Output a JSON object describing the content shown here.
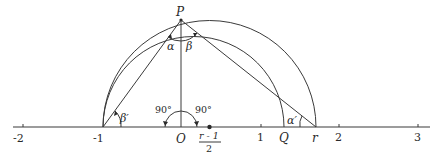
{
  "figure": {
    "type": "geometric construction on real number line",
    "colors": {
      "ink": "#3a3a3a",
      "background": "#ffffff"
    },
    "axis": {
      "tick_labels": [
        "-2",
        "-1",
        "1",
        "2",
        "3"
      ],
      "tick_values": [
        -2,
        -1,
        1,
        2,
        3
      ],
      "origin_label": "O"
    },
    "points": {
      "P": "P",
      "O": "O",
      "Q": "Q",
      "r": "r",
      "center_numerator": "r - 1",
      "center_denominator": "2"
    },
    "angles": {
      "alpha": "α",
      "beta": "β",
      "beta_prime": "β′",
      "alpha_prime": "α′",
      "right_left": "90°",
      "right_right": "90°"
    }
  }
}
